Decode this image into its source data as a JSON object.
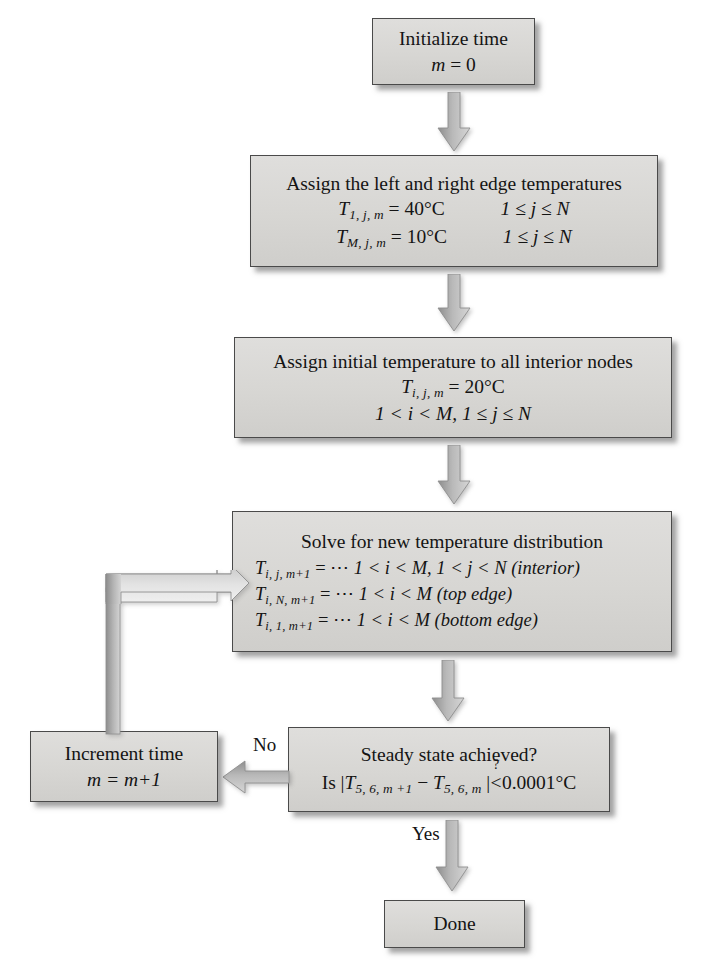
{
  "diagram": {
    "background_color": "#ffffff",
    "box_fill_color": "#d8d7d4",
    "box_border_color": "#4a4a4a",
    "arrow_color": "#9a9a9a"
  },
  "nodes": {
    "initialize": {
      "id": "initialize-time",
      "lines": [
        "Initialize time",
        "m = 0"
      ],
      "line1": "Initialize time",
      "line2_var": "m",
      "line2_rest": "= 0"
    },
    "edge_temps": {
      "id": "assign-edge-temperatures",
      "heading": "Assign the left and right edge temperatures",
      "rows": [
        {
          "symbol": "T",
          "subscript": "1, j, m",
          "value": "= 40°C",
          "condition": "1 ≤ j ≤ N"
        },
        {
          "symbol": "T",
          "subscript": "M, j, m",
          "value": "= 10°C",
          "condition": "1 ≤ j ≤ N"
        }
      ]
    },
    "initial_temps": {
      "id": "assign-initial-temperature",
      "heading": "Assign initial temperature to all interior nodes",
      "symbol": "T",
      "subscript": "i, j, m",
      "value": "= 20°C",
      "condition": "1 < i < M, 1 ≤ j ≤ N"
    },
    "solve": {
      "id": "solve-new-temperature-distribution",
      "heading": "Solve for new temperature distribution",
      "rows": [
        {
          "symbol": "T",
          "subscript": "i, j, m+1",
          "value": "= ⋯",
          "condition": "1 < i < M, 1 < j < N (interior)"
        },
        {
          "symbol": "T",
          "subscript": "i, N, m+1",
          "value": "= ⋯",
          "condition": "1 < i < M (top edge)"
        },
        {
          "symbol": "T",
          "subscript": "i, 1, m+1",
          "value": "= ⋯",
          "condition": "1 < i < M (bottom edge)"
        }
      ]
    },
    "decision": {
      "id": "steady-state-check",
      "heading": "Steady state achieved?",
      "test_prefix": "Is |",
      "test_t1_symbol": "T",
      "test_t1_sub": "5, 6, m +1",
      "test_minus": "−",
      "test_t2_symbol": "T",
      "test_t2_sub": "5, 6, m",
      "test_bar": "|",
      "test_relation_q": "?",
      "test_relation": "<",
      "test_value": "0.0001°C"
    },
    "increment": {
      "id": "increment-time",
      "line1": "Increment time",
      "line2_var": "m",
      "line2_rest": "= m+1"
    },
    "done": {
      "id": "done",
      "label": "Done"
    }
  },
  "edges": {
    "no_label": "No",
    "yes_label": "Yes"
  }
}
